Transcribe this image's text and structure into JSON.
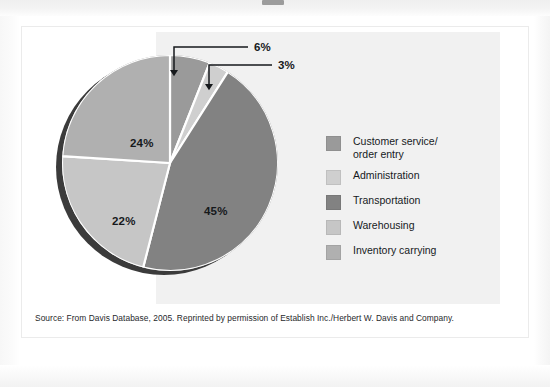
{
  "figure": {
    "source_note": "Source: From Davis Database, 2005. Reprinted by permission of Establish Inc./Herbert W. Davis and Company."
  },
  "chart_data": {
    "type": "pie",
    "title": "",
    "categories": [
      "Customer service/\norder entry",
      "Administration",
      "Transportation",
      "Warehousing",
      "Inventory carrying"
    ],
    "values": [
      6,
      3,
      45,
      22,
      24
    ],
    "value_labels": [
      "6%",
      "3%",
      "45%",
      "22%",
      "24%"
    ],
    "colors": [
      "#9a9a9a",
      "#cfcfcf",
      "#828282",
      "#c6c6c6",
      "#b0b0b0"
    ],
    "start_angle_deg": 0,
    "direction": "clockwise",
    "legend_position": "right",
    "grid": false,
    "callouts": [
      {
        "label": "6%",
        "target_slice": "Customer service/order entry"
      },
      {
        "label": "3%",
        "target_slice": "Administration"
      }
    ],
    "inner_labels": [
      {
        "label": "24%",
        "slice": "Inventory carrying"
      },
      {
        "label": "22%",
        "slice": "Warehousing"
      },
      {
        "label": "45%",
        "slice": "Transportation"
      }
    ]
  },
  "legend": {
    "items": [
      {
        "label": "Customer service/\norder entry",
        "color": "#9a9a9a"
      },
      {
        "label": "Administration",
        "color": "#cfcfcf"
      },
      {
        "label": "Transportation",
        "color": "#828282"
      },
      {
        "label": "Warehousing",
        "color": "#c6c6c6"
      },
      {
        "label": "Inventory carrying",
        "color": "#b0b0b0"
      }
    ]
  }
}
